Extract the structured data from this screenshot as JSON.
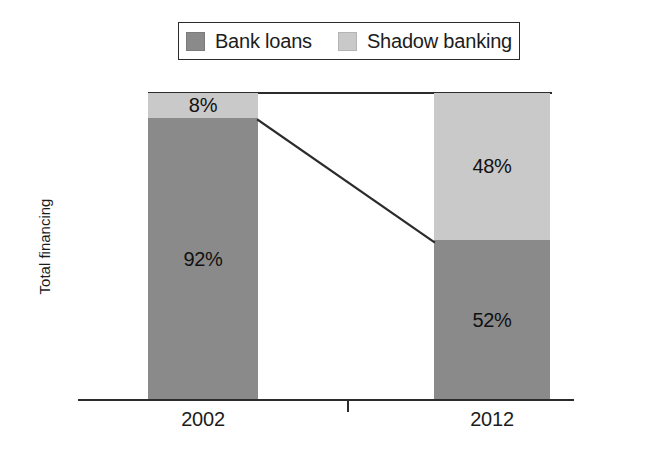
{
  "chart_data": {
    "type": "bar",
    "subtype": "stacked-bar-100",
    "title": "",
    "xlabel": "",
    "ylabel": "Total financing",
    "categories": [
      "2002",
      "2012"
    ],
    "series": [
      {
        "name": "Bank loans",
        "color": "#8a8a8a",
        "values": [
          92,
          48
        ]
      },
      {
        "name": "Shadow banking",
        "color": "#c9c9c9",
        "values": [
          8,
          52
        ]
      }
    ],
    "stack_order_top_to_bottom": [
      "Shadow banking",
      "Bank loans"
    ],
    "data_labels": {
      "2002": {
        "Shadow banking": "8%",
        "Bank loans": "92%"
      },
      "2012": {
        "Shadow banking": "48%",
        "Bank loans": "52%"
      }
    },
    "ylim": [
      0,
      100
    ],
    "y_ticks": [],
    "grid": false,
    "legend_position": "top-center",
    "annotations": [
      {
        "type": "connector-line",
        "description": "Line joining top of 2002 bank-loans segment to top of 2012 bank-loans segment",
        "from": {
          "category": "2002",
          "boundary": "Bank loans top",
          "value": 92
        },
        "to": {
          "category": "2012",
          "boundary": "Bank loans top",
          "value": 52
        },
        "color": "#2b2b2b"
      }
    ]
  },
  "legend": {
    "entries": [
      {
        "label": "Bank loans",
        "color": "#8a8a8a"
      },
      {
        "label": "Shadow banking",
        "color": "#c9c9c9"
      }
    ]
  },
  "axes": {
    "y_title": "Total financing",
    "x_categories": [
      {
        "label": "2002"
      },
      {
        "label": "2012"
      }
    ]
  },
  "bars": {
    "b2002": {
      "shadow_label": "8%",
      "bank_label": "92%"
    },
    "b2012": {
      "shadow_label": "48%",
      "bank_label": "52%"
    }
  },
  "colors": {
    "bank_loans": "#8a8a8a",
    "shadow_banking": "#c9c9c9",
    "line": "#2b2b2b",
    "background": "#ffffff"
  }
}
